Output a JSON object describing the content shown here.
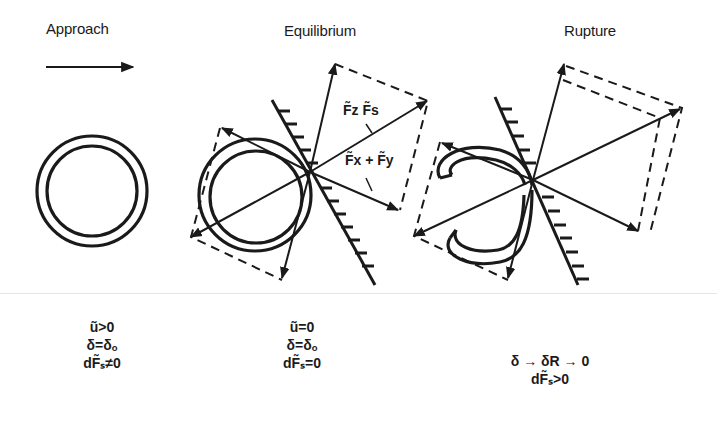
{
  "stages": [
    {
      "id": "approach",
      "title": "Approach",
      "conditions": [
        "ũ>0",
        "δ=δₒ",
        "dF̃ₛ≠0"
      ]
    },
    {
      "id": "equilibrium",
      "title": "Equilibrium",
      "conditions": [
        "ũ=0",
        "δ=δₒ",
        "dF̃ₛ=0"
      ],
      "force_labels": {
        "upper": "F̃z F̃s",
        "lower": "F̃x + F̃y"
      }
    },
    {
      "id": "rupture",
      "title": "Rupture",
      "conditions": [
        "δ → δR → 0",
        "dF̃ₛ>0"
      ]
    }
  ],
  "colors": {
    "ink": "#1a1a1a",
    "background": "#ffffff",
    "separator": "#e6e6e6"
  },
  "icons": {
    "approach_arrow": "arrow-right-icon",
    "wall": "hatched-wall-icon",
    "bubble": "double-ring-icon"
  }
}
